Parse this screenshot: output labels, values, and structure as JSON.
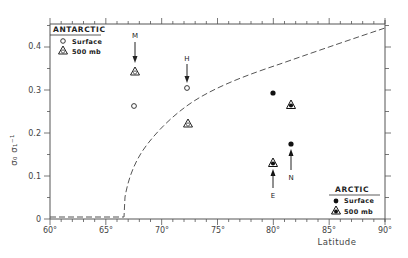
{
  "chart_data": {
    "type": "scatter",
    "title": "",
    "xlabel": "Latitude",
    "ylabel": "σ₀ σ₁⁻¹",
    "xlim": [
      60,
      90
    ],
    "ylim": [
      0,
      0.45
    ],
    "x_ticks": [
      "60°",
      "65°",
      "70°",
      "75°",
      "80°",
      "85°",
      "90°"
    ],
    "y_ticks": [
      "0",
      "0.1",
      "0.2",
      "0.3",
      "0.4"
    ],
    "grid": false,
    "series": [
      {
        "name": "Antarctic Surface",
        "marker": "open-circle",
        "points": [
          {
            "x": 67.6,
            "y": 0.26
          },
          {
            "x": 72.2,
            "y": 0.3,
            "label": "H"
          }
        ]
      },
      {
        "name": "Antarctic 500 mb",
        "marker": "open-triangle",
        "points": [
          {
            "x": 67.6,
            "y": 0.34,
            "label": "M"
          },
          {
            "x": 72.2,
            "y": 0.22
          }
        ]
      },
      {
        "name": "Arctic Surface",
        "marker": "filled-circle",
        "points": [
          {
            "x": 79.9,
            "y": 0.29
          },
          {
            "x": 81.5,
            "y": 0.17,
            "label": "N"
          }
        ]
      },
      {
        "name": "Arctic 500 mb",
        "marker": "filled-triangle",
        "points": [
          {
            "x": 81.5,
            "y": 0.26
          },
          {
            "x": 79.9,
            "y": 0.13,
            "label": "E"
          }
        ]
      },
      {
        "name": "Theoretical curve",
        "style": "dashed",
        "points": [
          {
            "x": 60,
            "y": 0.005
          },
          {
            "x": 66.7,
            "y": 0.005
          },
          {
            "x": 66.9,
            "y": 0.05
          },
          {
            "x": 67.5,
            "y": 0.11
          },
          {
            "x": 68.5,
            "y": 0.165
          },
          {
            "x": 70,
            "y": 0.22
          },
          {
            "x": 72,
            "y": 0.27
          },
          {
            "x": 75,
            "y": 0.31
          },
          {
            "x": 80,
            "y": 0.36
          },
          {
            "x": 85,
            "y": 0.405
          },
          {
            "x": 90,
            "y": 0.445
          }
        ]
      }
    ],
    "legends": [
      {
        "title": "ANTARCTIC",
        "position": "top-left",
        "entries": [
          "Surface",
          "500 mb"
        ]
      },
      {
        "title": "ARCTIC",
        "position": "bottom-right",
        "entries": [
          "Surface",
          "500 mb"
        ]
      }
    ],
    "annotations": [
      "M",
      "H",
      "E",
      "N"
    ]
  },
  "legend_antarctic": {
    "title": "ANTARCTIC",
    "surface": "Surface",
    "mb500": "500 mb"
  },
  "legend_arctic": {
    "title": "ARCTIC",
    "surface": "Surface",
    "mb500": "500 mb"
  },
  "axis": {
    "xlabel": "Latitude",
    "ylabel": "σ₀ σ₁⁻¹",
    "x_ticks": [
      "60°",
      "65°",
      "70°",
      "75°",
      "80°",
      "85°",
      "90°"
    ],
    "y_ticks": [
      "0",
      "0.1",
      "0.2",
      "0.3",
      "0.4"
    ]
  },
  "annotations": {
    "m": "M",
    "h": "H",
    "e": "E",
    "n": "N"
  }
}
